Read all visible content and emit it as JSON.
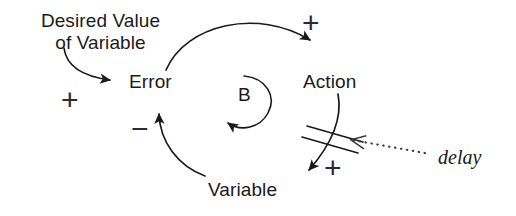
{
  "diagram": {
    "type": "causal-loop-diagram",
    "background_color": "#ffffff",
    "stroke_color": "#1a1a1a",
    "nodes": [
      {
        "id": "desired-value",
        "label_line1": "Desired Value",
        "label_line2": "of Variable",
        "label": "Desired Value of Variable",
        "x": 33,
        "y": 10
      },
      {
        "id": "error",
        "label": "Error",
        "x": 129,
        "y": 71
      },
      {
        "id": "action",
        "label": "Action",
        "x": 303,
        "y": 71
      },
      {
        "id": "variable",
        "label": "Variable",
        "x": 208,
        "y": 179
      }
    ],
    "loop": {
      "id": "B",
      "label": "B",
      "kind": "balancing",
      "x": 238,
      "y": 94
    },
    "links": [
      {
        "id": "desired-to-error",
        "from": "desired-value",
        "to": "error",
        "polarity": "+",
        "polarity_x": 61,
        "polarity_y": 85,
        "delay": false
      },
      {
        "id": "error-to-action",
        "from": "error",
        "to": "action",
        "polarity": "+",
        "polarity_x": 302,
        "polarity_y": 8,
        "delay": false
      },
      {
        "id": "action-to-variable",
        "from": "action",
        "to": "variable",
        "polarity": "+",
        "polarity_x": 324,
        "polarity_y": 153,
        "delay": true
      },
      {
        "id": "variable-to-error",
        "from": "variable",
        "to": "error",
        "polarity": "−",
        "polarity_x": 131,
        "polarity_y": 117,
        "delay": false
      }
    ],
    "annotations": [
      {
        "id": "delay-annotation",
        "label": "delay",
        "x": 438,
        "y": 146,
        "points_to": "action-to-variable",
        "style": "dotted-arrow"
      }
    ]
  }
}
